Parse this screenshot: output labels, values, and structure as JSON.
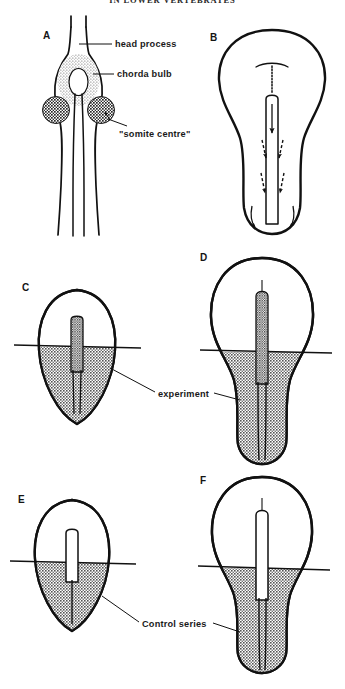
{
  "page": {
    "running_head": "IN LOWER VERTEBRATES",
    "background_color": "#ffffff",
    "ink_color": "#111111",
    "shade_color": "#8c8c8c"
  },
  "panels": [
    {
      "id": "A",
      "letter": "A",
      "description": "dorsal view of head process, chorda bulb and paired somite centres"
    },
    {
      "id": "B",
      "letter": "B",
      "description": "pear shaped embryo with notochord and morphogenetic movement arrows"
    },
    {
      "id": "C",
      "letter": "C",
      "description": "experiment, early stage, short stippled notochord with shaded posterior region"
    },
    {
      "id": "D",
      "letter": "D",
      "description": "experiment, later stage, elongated stippled notochord with shaded posterior region"
    },
    {
      "id": "E",
      "letter": "E",
      "description": "control series, early stage, short hollow notochord with shaded posterior region"
    },
    {
      "id": "F",
      "letter": "F",
      "description": "control series, later stage, elongated hollow notochord with shaded posterior region"
    }
  ],
  "labels": {
    "head_process": "head process",
    "chorda_bulb": "chorda bulb",
    "somite_centre": "\"somite centre\"",
    "experiment": "experiment",
    "control_series": "Control series"
  }
}
